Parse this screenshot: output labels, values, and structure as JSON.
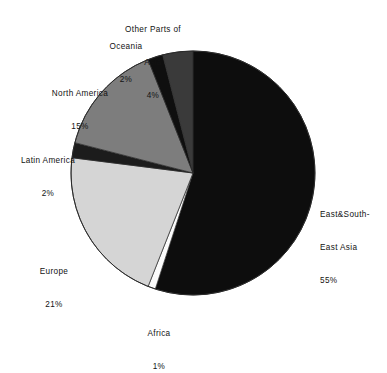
{
  "chart_data": {
    "type": "pie",
    "title": "",
    "subtitle": "",
    "xlabel": "",
    "ylabel": "",
    "legend_position": "none",
    "grid": false,
    "start_angle_deg": 0,
    "direction": "clockwise",
    "unit": "%",
    "categories": [
      "East&South-East Asia",
      "Africa",
      "Europe",
      "Latin America",
      "North America",
      "Oceania",
      "Other Parts of Asia"
    ],
    "values": [
      55,
      1,
      21,
      2,
      15,
      2,
      4
    ],
    "slices": [
      {
        "key": "east-asia",
        "name_lines": [
          "East&South-",
          "East Asia"
        ],
        "name": "East&South-East Asia",
        "value": 55,
        "value_label": "55%",
        "color": "#0d0d0d",
        "start_deg": 0,
        "end_deg": 198
      },
      {
        "key": "africa",
        "name_lines": [
          "Africa"
        ],
        "name": "Africa",
        "value": 1,
        "value_label": "1%",
        "color": "#fbfbfb",
        "start_deg": 198,
        "end_deg": 201.6
      },
      {
        "key": "europe",
        "name_lines": [
          "Europe"
        ],
        "name": "Europe",
        "value": 21,
        "value_label": "21%",
        "color": "#d5d5d5",
        "start_deg": 201.6,
        "end_deg": 277.2
      },
      {
        "key": "latin-america",
        "name_lines": [
          "Latin America"
        ],
        "name": "Latin America",
        "value": 2,
        "value_label": "2%",
        "color": "#1c1c1c",
        "start_deg": 277.2,
        "end_deg": 284.4
      },
      {
        "key": "north-america",
        "name_lines": [
          "North America"
        ],
        "name": "North America",
        "value": 15,
        "value_label": "15%",
        "color": "#7d7d7d",
        "start_deg": 284.4,
        "end_deg": 338.4
      },
      {
        "key": "oceania",
        "name_lines": [
          "Oceania"
        ],
        "name": "Oceania",
        "value": 2,
        "value_label": "2%",
        "color": "#0f0f0f",
        "start_deg": 338.4,
        "end_deg": 345.6
      },
      {
        "key": "other-asia",
        "name_lines": [
          "Other Parts of",
          "Asia"
        ],
        "name": "Other Parts of Asia",
        "value": 4,
        "value_label": "4%",
        "color": "#3a3a3a",
        "start_deg": 345.6,
        "end_deg": 360
      }
    ],
    "geometry": {
      "center_x": 193,
      "center_y": 173,
      "radius": 122
    }
  },
  "labels": {
    "east_asia": {
      "line1": "East&South-",
      "line2": "East Asia",
      "value": "55%"
    },
    "africa": {
      "line1": "Africa",
      "value": "1%"
    },
    "europe": {
      "line1": "Europe",
      "value": "21%"
    },
    "latin_america": {
      "line1": "Latin America",
      "value": "2%"
    },
    "north_america": {
      "line1": "North America",
      "value": "15%"
    },
    "oceania": {
      "line1": "Oceania",
      "value": "2%"
    },
    "other_asia": {
      "line1": "Other Parts of",
      "line2": "Asia",
      "value": "4%"
    }
  },
  "colors": {
    "background": "#ffffff",
    "text": "#121212",
    "outline": "#2a2a2a"
  }
}
